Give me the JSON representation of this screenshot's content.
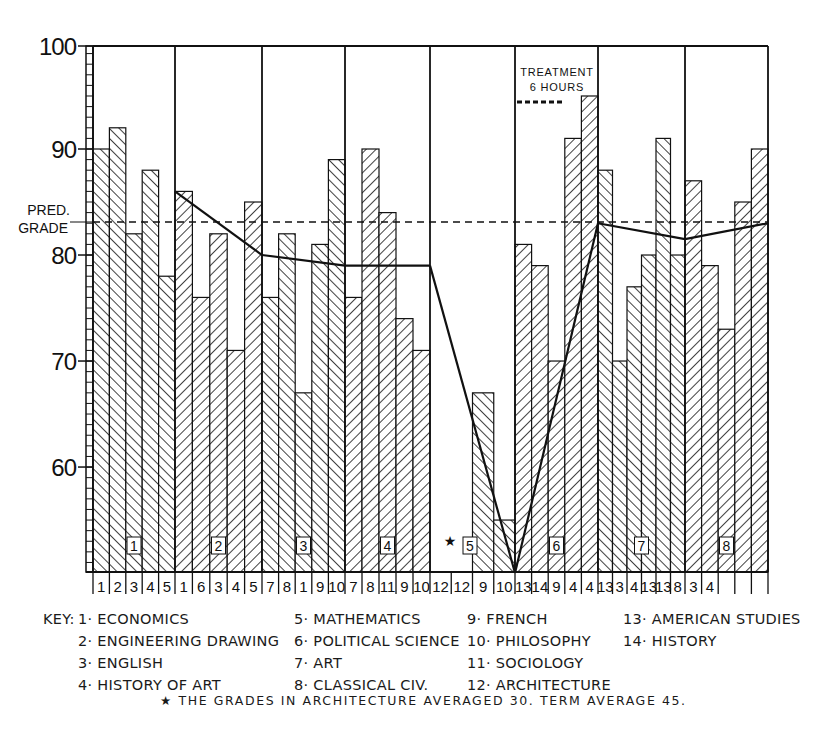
{
  "chart_data": {
    "type": "bar",
    "title": "",
    "xlabel": "",
    "ylabel": "",
    "ylim": [
      50,
      100
    ],
    "yticks": [
      60,
      70,
      80,
      90,
      100
    ],
    "grid": false,
    "predicted_grade": 83.5,
    "predicted_grade_label": [
      "PRED.",
      "GRADE"
    ],
    "annotation": {
      "lines": [
        "TREATMENT",
        "6 HOURS"
      ],
      "group": 6
    },
    "groups": [
      {
        "label": "1",
        "bars": [
          {
            "subject": "1",
            "value": 90
          },
          {
            "subject": "2",
            "value": 92
          },
          {
            "subject": "3",
            "value": 82
          },
          {
            "subject": "4",
            "value": 88
          },
          {
            "subject": "5",
            "value": 78
          }
        ],
        "trend": [
          null,
          null
        ]
      },
      {
        "label": "2",
        "bars": [
          {
            "subject": "1",
            "value": 86
          },
          {
            "subject": "6",
            "value": 76
          },
          {
            "subject": "3",
            "value": 82
          },
          {
            "subject": "4",
            "value": 71
          },
          {
            "subject": "5",
            "value": 85
          }
        ],
        "trend": [
          86,
          80
        ]
      },
      {
        "label": "3",
        "bars": [
          {
            "subject": "7",
            "value": 76
          },
          {
            "subject": "8",
            "value": 82
          },
          {
            "subject": "1",
            "value": 67
          },
          {
            "subject": "9",
            "value": 81
          },
          {
            "subject": "10",
            "value": 89
          }
        ],
        "trend": [
          80,
          79
        ]
      },
      {
        "label": "4",
        "bars": [
          {
            "subject": "7",
            "value": 76
          },
          {
            "subject": "8",
            "value": 90
          },
          {
            "subject": "11",
            "value": 84
          },
          {
            "subject": "9",
            "value": 74
          },
          {
            "subject": "10",
            "value": 71
          }
        ],
        "trend": [
          79,
          79
        ]
      },
      {
        "label": "5",
        "bars": [
          {
            "subject": "12",
            "value": null
          },
          {
            "subject": "12",
            "value": null
          },
          {
            "subject": "9",
            "value": 67
          },
          {
            "subject": "10",
            "value": 55
          }
        ],
        "trend": [
          79,
          50
        ]
      },
      {
        "label": "6",
        "bars": [
          {
            "subject": "13",
            "value": 81
          },
          {
            "subject": "14",
            "value": 79
          },
          {
            "subject": "9",
            "value": 70
          },
          {
            "subject": "4",
            "value": 91
          },
          {
            "subject": "4",
            "value": 95
          }
        ],
        "trend": [
          50,
          83
        ]
      },
      {
        "label": "7",
        "bars": [
          {
            "subject": "13",
            "value": 88
          },
          {
            "subject": "13",
            "value": 70
          },
          {
            "subject": "3",
            "value": 77
          },
          {
            "subject": "3",
            "value": 80
          },
          {
            "subject": "4",
            "value": 91
          },
          {
            "subject": "4",
            "value": 80
          }
        ],
        "trend": [
          83,
          81.5
        ]
      },
      {
        "label": "8",
        "bars": [
          {
            "subject": "13",
            "value": 87
          },
          {
            "subject": "13",
            "value": 79
          },
          {
            "subject": "8",
            "value": 73
          },
          {
            "subject": "3",
            "value": 85
          },
          {
            "subject": "4",
            "value": 90
          }
        ],
        "trend": [
          81.5,
          83
        ]
      }
    ],
    "x_tick_labels": [
      "1",
      "2",
      "3",
      "4",
      "5",
      "1",
      "6",
      "3",
      "4",
      "5",
      "7",
      "8",
      "1",
      "9",
      "10",
      "7",
      "8",
      "11",
      "9",
      "10",
      "12",
      "12",
      "9",
      "10",
      "13",
      "14",
      "9",
      "4",
      "4",
      "13",
      "3",
      "4",
      "13",
      "13",
      "8",
      "3",
      "4"
    ],
    "legend": [
      {
        "num": "1",
        "name": "ECONOMICS"
      },
      {
        "num": "2",
        "name": "ENGINEERING DRAWING"
      },
      {
        "num": "3",
        "name": "ENGLISH"
      },
      {
        "num": "4",
        "name": "HISTORY OF ART"
      },
      {
        "num": "5",
        "name": "MATHEMATICS"
      },
      {
        "num": "6",
        "name": "POLITICAL SCIENCE"
      },
      {
        "num": "7",
        "name": "ART"
      },
      {
        "num": "8",
        "name": "CLASSICAL CIV."
      },
      {
        "num": "9",
        "name": "FRENCH"
      },
      {
        "num": "10",
        "name": "PHILOSOPHY"
      },
      {
        "num": "11",
        "name": "SOCIOLOGY"
      },
      {
        "num": "12",
        "name": "ARCHITECTURE"
      },
      {
        "num": "13",
        "name": "AMERICAN STUDIES"
      },
      {
        "num": "14",
        "name": "HISTORY"
      }
    ],
    "footnote": "THE GRADES IN ARCHITECTURE AVERAGED 30.  TERM AVERAGE 45."
  },
  "key": {
    "prefix": "KEY:",
    "col1": [
      "1· ECONOMICS",
      "2· ENGINEERING DRAWING",
      "3· ENGLISH",
      "4· HISTORY OF ART"
    ],
    "col2": [
      "5· MATHEMATICS",
      "6· POLITICAL SCIENCE",
      "7· ART",
      "8· CLASSICAL CIV."
    ],
    "col3": [
      "9· FRENCH",
      "10· PHILOSOPHY",
      "11· SOCIOLOGY",
      "12· ARCHITECTURE"
    ],
    "col4": [
      "13· AMERICAN STUDIES",
      "14· HISTORY"
    ]
  },
  "footnote": {
    "star": "★",
    "text": "THE GRADES IN ARCHITECTURE AVERAGED 30.  TERM AVERAGE 45."
  },
  "colors": {
    "ink": "#111111",
    "paper": "#ffffff"
  }
}
